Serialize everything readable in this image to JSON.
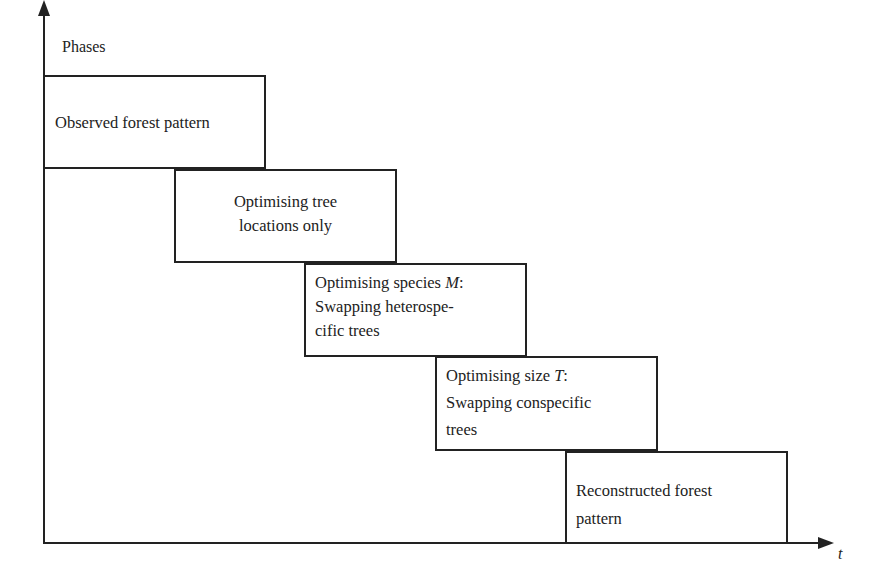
{
  "axes": {
    "y_label": "Phases",
    "x_label": "t"
  },
  "phases": [
    {
      "lines": [
        "Observed forest pattern"
      ]
    },
    {
      "lines": [
        "Optimising tree",
        "locations only"
      ]
    },
    {
      "lines_pre": "Optimising species ",
      "var": "M",
      "lines_post": ":",
      "lines": [
        "Swapping heterospe-",
        "cific trees"
      ]
    },
    {
      "lines_pre": "Optimising size ",
      "var": "T",
      "lines_post": ":",
      "lines": [
        "Swapping conspecific",
        "trees"
      ]
    },
    {
      "lines": [
        "Reconstructed forest",
        "pattern"
      ]
    }
  ]
}
